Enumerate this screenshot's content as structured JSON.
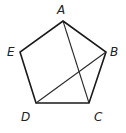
{
  "diagram": {
    "type": "regular-pentagon-with-diagonals",
    "vertices": [
      {
        "id": "A",
        "label": "A",
        "x": 63,
        "y": 21,
        "label_x": 61,
        "label_y": 14
      },
      {
        "id": "B",
        "label": "B",
        "x": 106,
        "y": 52,
        "label_x": 111,
        "label_y": 56
      },
      {
        "id": "C",
        "label": "C",
        "x": 89,
        "y": 103,
        "label_x": 95,
        "label_y": 121
      },
      {
        "id": "D",
        "label": "D",
        "x": 36,
        "y": 103,
        "label_x": 22,
        "label_y": 121
      },
      {
        "id": "E",
        "label": "E",
        "x": 20,
        "y": 52,
        "label_x": 8,
        "label_y": 56
      }
    ],
    "edges": [
      [
        "A",
        "B"
      ],
      [
        "B",
        "C"
      ],
      [
        "C",
        "D"
      ],
      [
        "D",
        "E"
      ],
      [
        "E",
        "A"
      ]
    ],
    "diagonals": [
      [
        "A",
        "C"
      ],
      [
        "D",
        "B"
      ]
    ],
    "colors": {
      "stroke": "#1a1a1a",
      "label": "#222222",
      "background": "#ffffff"
    }
  }
}
